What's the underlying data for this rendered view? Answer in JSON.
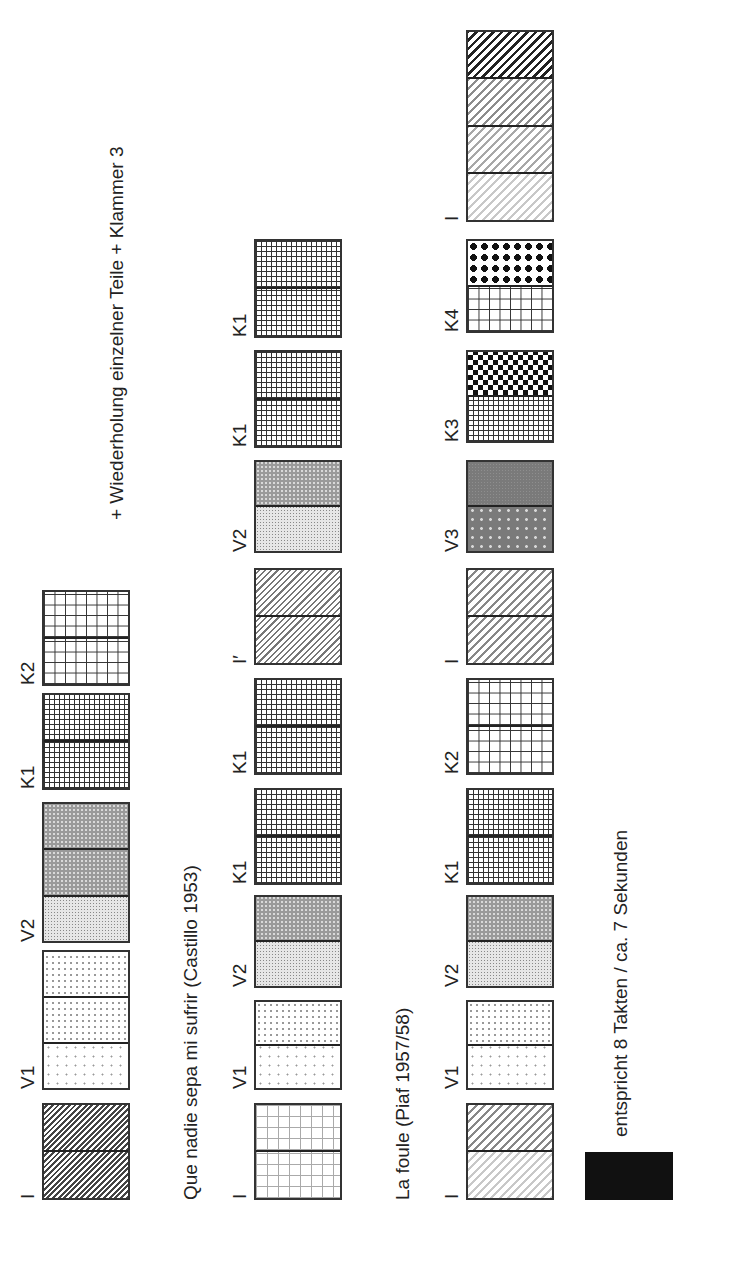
{
  "annotation": "+ Wiederholung einzelner Teile + Klammer 3",
  "rows": [
    {
      "title": "",
      "blocks": [
        {
          "label": "I",
          "sections": [
            "diag-dark",
            "diag-dark"
          ]
        },
        {
          "label": "V1",
          "sections": [
            "dots-sparse",
            "dots-med",
            "dots-med"
          ]
        },
        {
          "label": "V2",
          "sections": [
            "dots-fine",
            "crosshatch",
            "crosshatch"
          ]
        },
        {
          "label": "K1",
          "sections": [
            "grid-fine",
            "grid-fine"
          ]
        },
        {
          "label": "K2",
          "sections": [
            "grid-coarse",
            "grid-coarse"
          ]
        }
      ]
    },
    {
      "title": "Que nadie sepa mi sufrir (Castillo 1953)",
      "blocks": [
        {
          "label": "I",
          "sections": [
            "grid-dotted",
            "grid-dotted"
          ]
        },
        {
          "label": "V1",
          "sections": [
            "dots-sparse",
            "dots-med"
          ]
        },
        {
          "label": "V2",
          "sections": [
            "dots-fine",
            "crosshatch"
          ]
        },
        {
          "label": "K1",
          "sections": [
            "grid-fine",
            "grid-fine"
          ]
        },
        {
          "label": "K1",
          "sections": [
            "grid-fine",
            "grid-fine"
          ]
        },
        {
          "label": "I′",
          "sections": [
            "diag-mid",
            "diag-mid"
          ]
        },
        {
          "label": "V2",
          "sections": [
            "dots-fine",
            "crosshatch"
          ]
        },
        {
          "label": "K1",
          "sections": [
            "grid-fine",
            "grid-fine"
          ]
        },
        {
          "label": "K1",
          "sections": [
            "grid-fine",
            "grid-fine"
          ]
        }
      ]
    },
    {
      "title": "La foule (Piaf 1957/58)",
      "blocks": [
        {
          "label": "I",
          "sections": [
            "diag-g1",
            "diag-lafoule2"
          ]
        },
        {
          "label": "V1",
          "sections": [
            "dots-sparse",
            "dots-med"
          ]
        },
        {
          "label": "V2",
          "sections": [
            "dots-fine",
            "crosshatch"
          ]
        },
        {
          "label": "K1",
          "sections": [
            "grid-fine",
            "grid-fine"
          ]
        },
        {
          "label": "K2",
          "sections": [
            "grid-coarse",
            "grid-coarse"
          ]
        },
        {
          "label": "I",
          "sections": [
            "diag-lafoule2",
            "diag-lafoule2"
          ]
        },
        {
          "label": "V3",
          "sections": [
            "gray-dots",
            "solid-gray"
          ]
        },
        {
          "label": "K3",
          "sections": [
            "grid-fine",
            "checker"
          ]
        },
        {
          "label": "K4",
          "sections": [
            "grid-coarse",
            "diamonds"
          ]
        },
        {
          "label": "I",
          "sections": [
            "diag-g1",
            "diag-g2",
            "diag-g3",
            "diag-g4"
          ]
        }
      ]
    }
  ],
  "legend": {
    "swatch_color": "#111111",
    "text": "entspricht 8 Takten / ca. 7 Sekunden"
  }
}
